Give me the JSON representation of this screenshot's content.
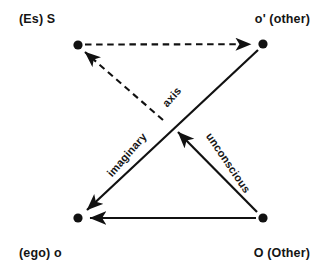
{
  "diagram": {
    "type": "node-edge-diagram",
    "background_color": "#ffffff",
    "stroke_color": "#111111",
    "corners": {
      "top_left": {
        "label": "(Es) S",
        "node_name": "node-es-s",
        "x": 78,
        "y": 45
      },
      "top_right": {
        "label": "o' (other)",
        "node_name": "node-o-prime",
        "x": 263,
        "y": 44
      },
      "bottom_left": {
        "label": "(ego) o",
        "node_name": "node-ego-o",
        "x": 78,
        "y": 218
      },
      "bottom_right": {
        "label": "O (Other)",
        "node_name": "node-o-other",
        "x": 263,
        "y": 218
      }
    },
    "edges": [
      {
        "id": "edge-top",
        "from": "node-es-s",
        "to": "node-o-prime",
        "style": "dashed",
        "arrow": "to",
        "label": ""
      },
      {
        "id": "edge-bottom",
        "from": "node-o-other",
        "to": "node-ego-o",
        "style": "solid",
        "arrow": "to",
        "label": ""
      },
      {
        "id": "edge-imaginary-axis",
        "from": "node-o-prime",
        "to": "node-ego-o",
        "style": "solid",
        "arrow": "to",
        "labels": [
          "axis",
          "imaginary"
        ]
      },
      {
        "id": "edge-unconscious",
        "from": "node-o-other",
        "to": "center",
        "style": "solid",
        "arrow": "to",
        "label": "unconscious"
      },
      {
        "id": "edge-unconscious-dashed",
        "from": "center",
        "to": "node-es-s",
        "style": "dashed",
        "arrow": "to",
        "label": ""
      }
    ],
    "edge_labels": {
      "axis": "axis",
      "imaginary": "imaginary",
      "unconscious": "unconscious"
    }
  }
}
